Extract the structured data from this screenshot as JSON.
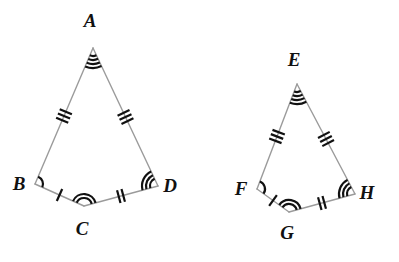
{
  "figure": {
    "stroke_color": "#9b9b9b",
    "mark_color": "#111111",
    "background": "#ffffff",
    "line_width": 1.4,
    "mark_width": 2.2
  },
  "left_shape": {
    "name": "ABCD",
    "vertices": [
      {
        "label": "A",
        "id": "A",
        "x": 93,
        "y": 48,
        "label_x": 90,
        "label_y": 27,
        "arcs": 4
      },
      {
        "label": "B",
        "id": "B",
        "x": 35,
        "y": 184,
        "label_x": 19,
        "label_y": 190,
        "arcs": 1
      },
      {
        "label": "C",
        "id": "C",
        "x": 84,
        "y": 206,
        "label_x": 82,
        "label_y": 235,
        "arcs": 2
      },
      {
        "label": "D",
        "id": "D",
        "x": 158,
        "y": 186,
        "label_x": 170,
        "label_y": 192,
        "arcs": 3
      }
    ],
    "sides": [
      {
        "name": "AB",
        "from": "A",
        "to": "B",
        "ticks": 3
      },
      {
        "name": "BC",
        "from": "B",
        "to": "C",
        "ticks": 1
      },
      {
        "name": "CD",
        "from": "C",
        "to": "D",
        "ticks": 2
      },
      {
        "name": "DA",
        "from": "D",
        "to": "A",
        "ticks": 3
      }
    ]
  },
  "right_shape": {
    "name": "EFGH",
    "vertices": [
      {
        "label": "E",
        "id": "E",
        "x": 297,
        "y": 84,
        "label_x": 294,
        "label_y": 66,
        "arcs": 4
      },
      {
        "label": "F",
        "id": "F",
        "x": 257,
        "y": 189,
        "label_x": 241,
        "label_y": 195,
        "arcs": 1
      },
      {
        "label": "G",
        "id": "G",
        "x": 289,
        "y": 212,
        "label_x": 287,
        "label_y": 239,
        "arcs": 2
      },
      {
        "label": "H",
        "id": "H",
        "x": 355,
        "y": 194,
        "label_x": 367,
        "label_y": 199,
        "arcs": 3
      }
    ],
    "sides": [
      {
        "name": "EF",
        "from": "E",
        "to": "F",
        "ticks": 3
      },
      {
        "name": "FG",
        "from": "F",
        "to": "G",
        "ticks": 1
      },
      {
        "name": "GH",
        "from": "G",
        "to": "H",
        "ticks": 2
      },
      {
        "name": "HE",
        "from": "H",
        "to": "E",
        "ticks": 3
      }
    ]
  }
}
